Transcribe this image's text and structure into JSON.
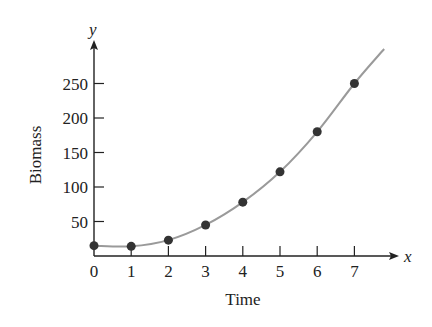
{
  "chart_data": {
    "type": "scatter",
    "title": "",
    "xlabel": "Time",
    "ylabel": "Biomass",
    "x_axis_variable": "x",
    "y_axis_variable": "y",
    "x": [
      0,
      1,
      2,
      3,
      4,
      5,
      6,
      7
    ],
    "series": [
      {
        "name": "Biomass observations",
        "values": [
          15,
          14,
          23,
          45,
          78,
          122,
          180,
          250
        ],
        "marker": "filled-circle",
        "color": "#333333"
      },
      {
        "name": "Fitted curve",
        "type": "line",
        "description": "smooth increasing curve through data, slight dip near x=1",
        "color": "#9a9a9a",
        "x_range": [
          0,
          7.8
        ]
      }
    ],
    "x_ticks": [
      0,
      1,
      2,
      3,
      4,
      5,
      6,
      7
    ],
    "x_tick_labels": [
      "0",
      "1",
      "2",
      "3",
      "4",
      "5",
      "6",
      "7"
    ],
    "y_ticks": [
      50,
      100,
      150,
      200,
      250
    ],
    "y_tick_labels": [
      "50",
      "100",
      "150",
      "200",
      "250"
    ],
    "xlim": [
      0,
      8
    ],
    "ylim": [
      0,
      300
    ],
    "grid": false,
    "legend": null,
    "colors": {
      "axis": "#222222",
      "points": "#333333",
      "curve": "#9a9a9a"
    }
  }
}
